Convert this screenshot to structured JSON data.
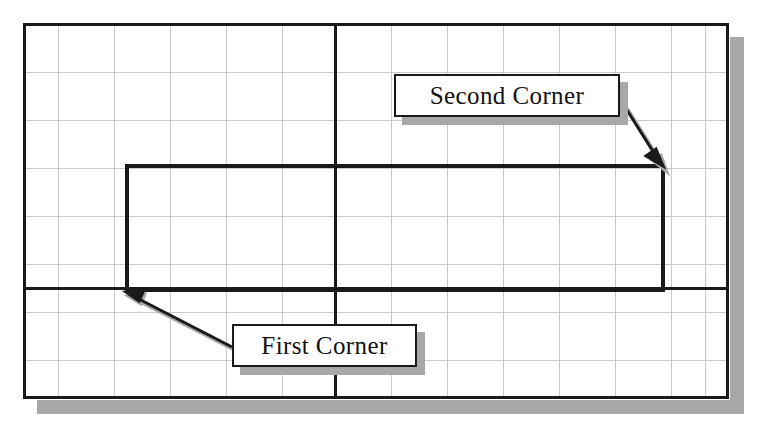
{
  "canvas": {
    "width": 760,
    "height": 421,
    "background": "#ffffff"
  },
  "colors": {
    "frame_stroke": "#1a1a1a",
    "grid_line": "#c9c9c9",
    "heavy_line": "#1a1a1a",
    "rectangle_stroke": "#1a1a1a",
    "shadow": "#a8a8a8",
    "callout_border": "#1a1a1a",
    "callout_fill": "#ffffff",
    "text": "#111111",
    "arrow": "#1a1a1a"
  },
  "drawing_area": {
    "name": "cad-drawing-frame",
    "x": 23,
    "y": 23,
    "width": 705,
    "height": 375,
    "shadow_offset": 14
  },
  "grid": {
    "vertical_spacing": 56,
    "horizontal_spacing": 48,
    "vertical_lines": [
      58,
      114,
      170,
      226,
      282,
      335,
      391,
      447,
      503,
      559,
      615,
      671
    ],
    "horizontal_lines": [
      72,
      120,
      168,
      216,
      264,
      288,
      312,
      360
    ],
    "axis_vertical_x": 335,
    "axis_horizontal_y": 288
  },
  "rectangle": {
    "name": "drawn-rectangle",
    "first_corner": {
      "x": 127,
      "y": 290
    },
    "second_corner": {
      "x": 663,
      "y": 166
    },
    "left": 127,
    "top": 166,
    "width": 536,
    "height": 124,
    "stroke_width": 4
  },
  "callouts": [
    {
      "id": "second-corner",
      "label": "Second Corner",
      "box": {
        "x": 394,
        "y": 74,
        "width": 226,
        "height": 43
      },
      "arrow": {
        "from_x": 620,
        "from_y": 99,
        "to_x": 661,
        "to_y": 164
      }
    },
    {
      "id": "first-corner",
      "label": "First Corner",
      "box": {
        "x": 232,
        "y": 324,
        "width": 185,
        "height": 43
      },
      "arrow": {
        "from_x": 232,
        "from_y": 347,
        "to_x": 128,
        "to_y": 294
      }
    }
  ]
}
